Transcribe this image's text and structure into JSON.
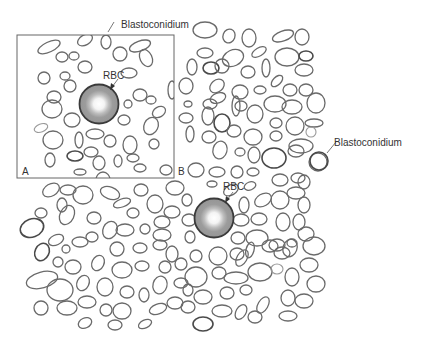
{
  "figure": {
    "panels": [
      {
        "id": "A",
        "label": "A"
      },
      {
        "id": "B",
        "label": "B"
      }
    ],
    "annotations": {
      "panel_a_blastoconidium": "Blastoconidium",
      "panel_a_rbc": "RBC",
      "panel_b_blastoconidium": "Blastoconidium",
      "panel_b_rbc": "RBC"
    },
    "colors": {
      "rbc_fill": "#9c9c9c",
      "rbc_center": "#ffffff",
      "rbc_outline": "#3a3a3a",
      "cell_outline": "#6a6a6a",
      "frame": "#666666",
      "background": "#ffffff"
    }
  }
}
